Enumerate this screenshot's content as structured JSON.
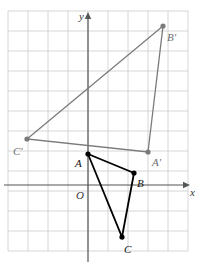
{
  "figure": {
    "background": "#ffffff",
    "width": 201,
    "height": 268
  },
  "grid": {
    "color": "#cccccc",
    "spacing_px": 20,
    "x_start_px": 8,
    "y_start_px": 11,
    "x_end_px": 188,
    "y_end_px": 251,
    "visible": true
  },
  "axes": {
    "color": "#555555",
    "x_axis": {
      "label": "x",
      "y_px": 185,
      "x_from_px": 4,
      "x_to_px": 190,
      "arrow": "right",
      "label_x_px": 190,
      "label_y_px": 196
    },
    "y_axis": {
      "label": "y",
      "x_px": 88,
      "y_from_px": 12,
      "y_to_px": 262,
      "arrow": "up",
      "label_x_px": 79,
      "label_y_px": 20
    },
    "origin": {
      "label": "O",
      "x_px": 88,
      "y_px": 185,
      "label_x_px": 76,
      "label_y_px": 199
    }
  },
  "shapes": [
    {
      "name": "triangle-abc",
      "label": "Triangle ABC",
      "color": "#000000",
      "stroke_width": 1.8,
      "fill": "none",
      "vertex_marker": "filled-dot",
      "vertex_radius": 2.6,
      "vertices": [
        {
          "label": "A",
          "x_px": 88,
          "y_px": 154,
          "label_x_px": 75,
          "label_y_px": 167
        },
        {
          "label": "B",
          "x_px": 134,
          "y_px": 173,
          "label_x_px": 137,
          "label_y_px": 187
        },
        {
          "label": "C",
          "x_px": 122,
          "y_px": 237,
          "label_x_px": 124,
          "label_y_px": 253
        }
      ]
    },
    {
      "name": "triangle-a-prime-b-prime-c-prime",
      "label": "Triangle A'B'C'",
      "color": "#7a7a7a",
      "stroke_width": 1.3,
      "fill": "none",
      "vertex_marker": "filled-dot",
      "vertex_radius": 2.6,
      "vertices": [
        {
          "label": "A'",
          "x_px": 148,
          "y_px": 152,
          "label_x_px": 152,
          "label_y_px": 166
        },
        {
          "label": "B'",
          "x_px": 163,
          "y_px": 26,
          "label_x_px": 167,
          "label_y_px": 41
        },
        {
          "label": "C'",
          "x_px": 27,
          "y_px": 139,
          "label_x_px": 13,
          "label_y_px": 155
        }
      ]
    }
  ]
}
